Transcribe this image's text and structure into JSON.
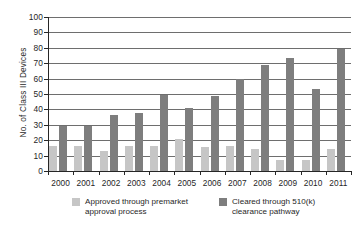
{
  "chart_data": {
    "type": "bar",
    "title": "",
    "subtitle": "",
    "xlabel": "",
    "ylabel": "No. of Class III Devices",
    "ylim": [
      0,
      100
    ],
    "yticks": [
      0,
      10,
      20,
      30,
      40,
      50,
      60,
      70,
      80,
      90,
      100
    ],
    "grid": true,
    "legend_position": "bottom",
    "categories": [
      "2000",
      "2001",
      "2002",
      "2003",
      "2004",
      "2005",
      "2006",
      "2007",
      "2008",
      "2009",
      "2010",
      "2011"
    ],
    "series": [
      {
        "name": "Approved through premarket approval process",
        "color": "#c6c6c6",
        "values": [
          16,
          16,
          13,
          16,
          16,
          21,
          15.5,
          16,
          14,
          7,
          7,
          14.5
        ]
      },
      {
        "name": "Cleared through 510(k) clearance pathway",
        "color": "#7e7e7e",
        "values": [
          29,
          29,
          36.5,
          37.5,
          49.5,
          41,
          49,
          60,
          69,
          73.5,
          53.5,
          79.5
        ]
      }
    ]
  },
  "legend": {
    "entries": [
      {
        "label": "Approved through premarket approval process"
      },
      {
        "label": "Cleared through 510(k) clearance pathway"
      }
    ]
  }
}
